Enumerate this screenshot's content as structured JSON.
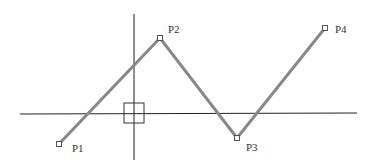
{
  "diagram": {
    "axes": {
      "horizontal": {
        "x1": 20,
        "y1": 114,
        "x2": 357,
        "y2": 113
      },
      "vertical": {
        "x1": 134,
        "y1": 14,
        "x2": 134,
        "y2": 160
      },
      "color": "#222222"
    },
    "pick_box": {
      "x": 124,
      "y": 103,
      "size": 20,
      "color": "#333333"
    },
    "polyline": {
      "color": "#888888",
      "width": 3,
      "points": [
        {
          "id": "P1",
          "label": "P1",
          "x": 59,
          "y": 144,
          "lx": 72,
          "ly": 152
        },
        {
          "id": "P2",
          "label": "P2",
          "x": 160,
          "y": 38,
          "lx": 168,
          "ly": 33
        },
        {
          "id": "P3",
          "label": "P3",
          "x": 237,
          "y": 138,
          "lx": 246,
          "ly": 151
        },
        {
          "id": "P4",
          "label": "P4",
          "x": 325,
          "y": 28,
          "lx": 335,
          "ly": 33
        }
      ]
    },
    "labels": {
      "p1": "P1",
      "p2": "P2",
      "p3": "P3",
      "p4": "P4"
    }
  }
}
